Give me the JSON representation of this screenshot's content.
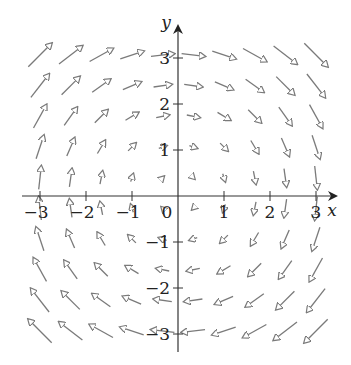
{
  "chart_data": {
    "type": "vector_field",
    "title": "",
    "field": "F(x, y) = (y, -x)",
    "xlabel": "x",
    "ylabel": "y",
    "xlim": [
      -3.3,
      3.4
    ],
    "ylim": [
      -3.4,
      3.4
    ],
    "grid": false,
    "x_ticks": [
      -3,
      -2,
      -1,
      1,
      2,
      3
    ],
    "y_ticks": [
      -3,
      -2,
      -1,
      1,
      2,
      3
    ],
    "x_tick_labels": [
      "−3",
      "−2",
      "−1",
      "1",
      "2",
      "3"
    ],
    "y_tick_labels": [
      "−3",
      "−2",
      "−1",
      "1",
      "2",
      "3"
    ],
    "origin_label": "0",
    "sample_points": [
      -3,
      -2.333,
      -1.667,
      -1,
      -0.333,
      0.333,
      1,
      1.667,
      2.333,
      3
    ],
    "arrow_color": "#7a7a7a",
    "axis_color": "#333333"
  }
}
